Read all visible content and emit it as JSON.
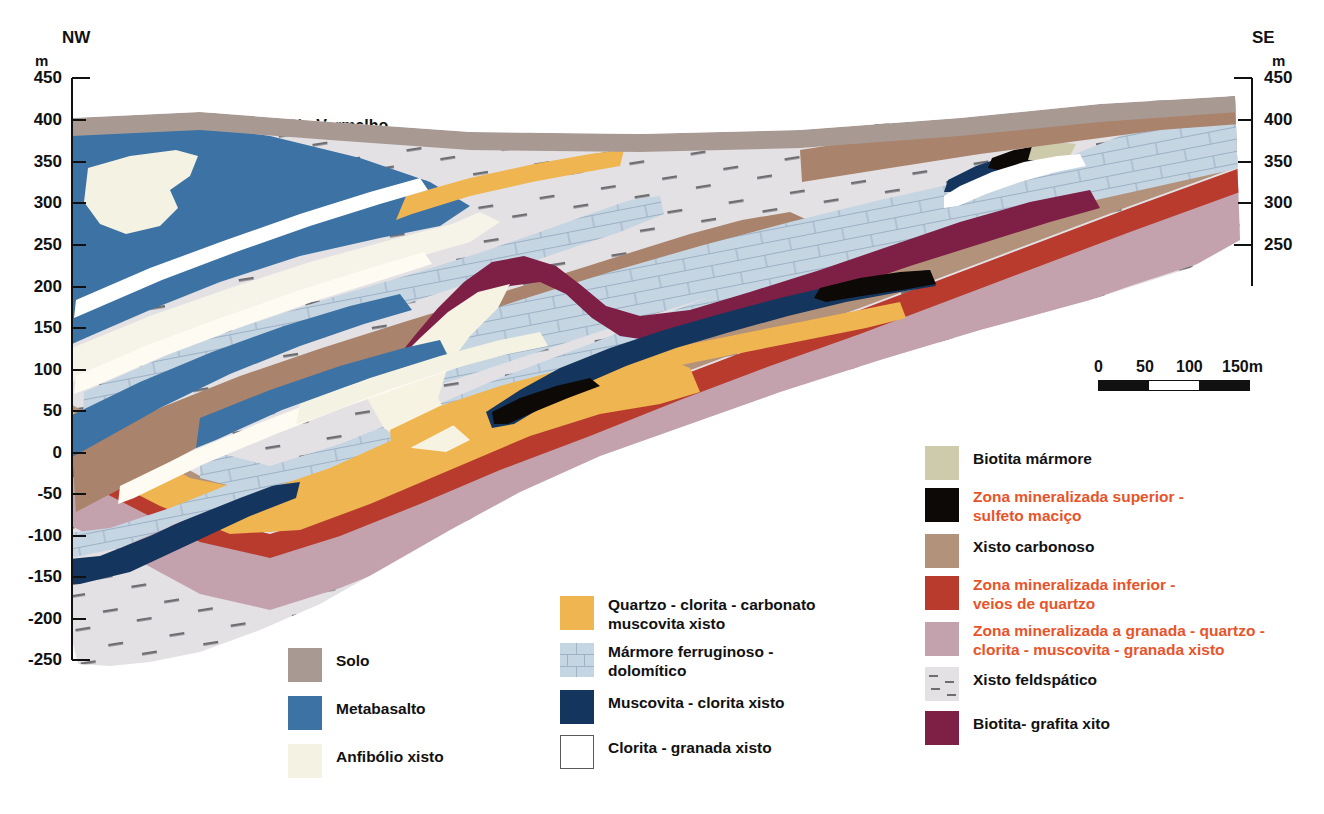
{
  "figure": {
    "type": "geological-cross-section",
    "orientation_left": "NW",
    "orientation_right": "SE",
    "river_label": "Rio Vermelho",
    "unit_symbol": "m"
  },
  "axes": {
    "left": {
      "unit": "m",
      "ticks": [
        450,
        400,
        350,
        300,
        250,
        200,
        150,
        100,
        50,
        0,
        -50,
        -100,
        -150,
        -200,
        -250
      ],
      "labels": [
        "450",
        "400",
        "350",
        "300",
        "250",
        "200",
        "150",
        "100",
        "50",
        "0",
        "-50",
        "-100",
        "-150",
        "-200",
        "-250"
      ],
      "min": -250,
      "max": 450,
      "step": 50
    },
    "right": {
      "unit": "m",
      "ticks": [
        450,
        400,
        350,
        300,
        250
      ],
      "labels": [
        "450",
        "400",
        "350",
        "300",
        "250"
      ],
      "min": 250,
      "max": 450,
      "step": 50
    }
  },
  "scalebar": {
    "labels": [
      "0",
      "50",
      "100",
      "150m"
    ],
    "values": [
      0,
      50,
      100,
      150
    ],
    "unit": "m",
    "segments": [
      "fill",
      "empty",
      "fill"
    ]
  },
  "legend": {
    "columns": [
      {
        "id": "left",
        "items": [
          {
            "label": "Solo",
            "color": "#a89a92",
            "text_color": "black",
            "pattern": "solid"
          },
          {
            "label": "Metabasalto",
            "color": "#3d72a4",
            "text_color": "black",
            "pattern": "solid"
          },
          {
            "label": "Anfibólio xisto",
            "color": "#f4f2e2",
            "text_color": "black",
            "pattern": "solid"
          }
        ]
      },
      {
        "id": "middle",
        "items": [
          {
            "label": "Quartzo - clorita - carbonato muscovita xisto",
            "label_line1": "Quartzo - clorita - carbonato",
            "label_line2": "muscovita xisto",
            "color": "#efb551",
            "text_color": "black",
            "pattern": "solid"
          },
          {
            "label": "Mármore ferruginoso - dolomítico",
            "label_line1": "Mármore ferruginoso -",
            "label_line2": "dolomítico",
            "color": "#c6d5e2",
            "text_color": "black",
            "pattern": "brick"
          },
          {
            "label": "Muscovita - clorita xisto",
            "color": "#14365e",
            "text_color": "black",
            "pattern": "solid"
          },
          {
            "label": "Clorita - granada xisto",
            "color": "#ffffff",
            "text_color": "black",
            "pattern": "outlined"
          }
        ]
      },
      {
        "id": "right",
        "items": [
          {
            "label": "Biotita mármore",
            "color": "#cdcbab",
            "text_color": "black",
            "pattern": "solid"
          },
          {
            "label": "Zona mineralizada superior - sulfeto maciço",
            "label_line1": "Zona mineralizada superior -",
            "label_line2": "sulfeto maciço",
            "color": "#0d0906",
            "text_color": "red",
            "pattern": "solid"
          },
          {
            "label": "Xisto carbonoso",
            "color": "#b3927b",
            "text_color": "black",
            "pattern": "solid"
          },
          {
            "label": "Zona mineralizada inferior - veios de quartzo",
            "label_line1": "Zona mineralizada inferior -",
            "label_line2": "veios de quartzo",
            "color": "#b93b2e",
            "text_color": "red",
            "pattern": "solid"
          },
          {
            "label": "Zona mineralizada a granada - quartzo - clorita - muscovita - granada xisto",
            "label_line1": "Zona mineralizada a granada - quartzo -",
            "label_line2": "clorita - muscovita - granada xisto",
            "color": "#c3a2ad",
            "text_color": "red",
            "pattern": "solid"
          },
          {
            "label": "Xisto feldspático",
            "color": "#e3e1e4",
            "text_color": "black",
            "pattern": "dashed"
          },
          {
            "label": "Biotita- grafita xito",
            "color": "#7e1f46",
            "text_color": "black",
            "pattern": "solid"
          }
        ]
      }
    ]
  },
  "colors": {
    "solo": "#a89a92",
    "metabasalto": "#3d72a4",
    "anfibolio_xisto": "#f4f2e2",
    "quartzo_clorita_carbonato": "#efb551",
    "marmore_ferruginoso": "#c6d5e2",
    "marmore_line": "#9fb3c6",
    "muscovita_clorita": "#14365e",
    "clorita_granada": "#ffffff",
    "biotita_marmore": "#cdcbab",
    "sulfeto_macico": "#0d0906",
    "xisto_carbonoso": "#b3927b",
    "veios_de_quartzo": "#b93b2e",
    "zona_granada": "#c3a2ad",
    "xisto_feldspatico": "#e3e1e4",
    "biotita_grafita": "#7e1f46",
    "legend_red_text": "#e8542a",
    "axis": "#111111"
  }
}
